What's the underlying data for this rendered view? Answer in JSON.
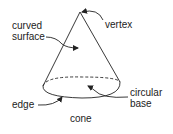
{
  "diagram": {
    "title": "cone",
    "labels": {
      "vertex": "vertex",
      "curved_surface_line1": "curved",
      "curved_surface_line2": "surface",
      "circular_base_line1": "circular",
      "circular_base_line2": "base",
      "edge": "edge"
    },
    "colors": {
      "stroke": "#222222",
      "text": "#222222",
      "background": "#ffffff"
    }
  }
}
